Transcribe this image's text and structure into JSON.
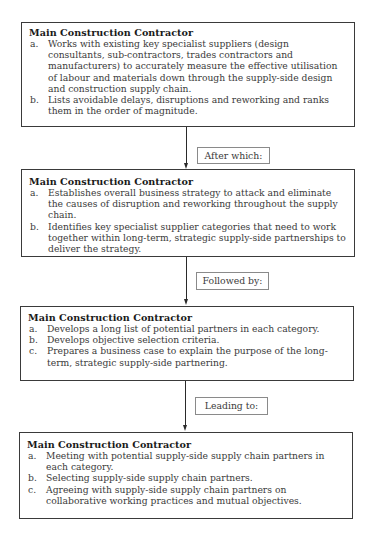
{
  "diagram": {
    "steps": [
      {
        "title": "Main Construction Contractor",
        "items": [
          {
            "marker": "a.",
            "text": "Works with existing key specialist suppliers (design consultants, sub-contractors, trades contractors and manufacturers) to accurately measure the effective utilisation of labour and materials down through the supply-side design and construction supply chain."
          },
          {
            "marker": "b.",
            "text": "Lists avoidable delays, disruptions and reworking and ranks them in the order of magnitude."
          }
        ]
      },
      {
        "title": "Main Construction Contractor",
        "items": [
          {
            "marker": "a.",
            "text": "Establishes overall business strategy to attack and eliminate the causes of disruption and reworking throughout the supply chain."
          },
          {
            "marker": "b.",
            "text": "Identifies key specialist supplier categories that need to work together within long-term, strategic supply-side partnerships to deliver the strategy."
          }
        ]
      },
      {
        "title": "Main Construction Contractor",
        "items": [
          {
            "marker": "a.",
            "text": "Develops a long list of potential partners in each category."
          },
          {
            "marker": "b.",
            "text": "Develops objective selection criteria."
          },
          {
            "marker": "c.",
            "text": "Prepares a business case to explain the purpose of the long-term, strategic supply-side partnering."
          }
        ]
      },
      {
        "title": "Main Construction Contractor",
        "items": [
          {
            "marker": "a.",
            "text": "Meeting with potential supply-side supply chain partners in each category."
          },
          {
            "marker": "b.",
            "text": "Selecting supply-side supply chain partners."
          },
          {
            "marker": "c.",
            "text": "Agreeing with supply-side supply chain partners on collaborative working practices and mutual objectives."
          }
        ]
      }
    ],
    "connectors": [
      {
        "label": "After which:"
      },
      {
        "label": "Followed by:"
      },
      {
        "label": "Leading to:"
      }
    ]
  }
}
